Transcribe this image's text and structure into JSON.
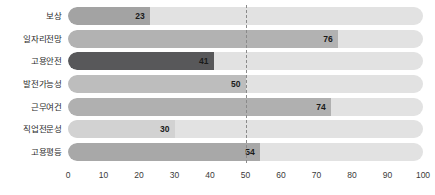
{
  "chart_data": {
    "type": "bar",
    "orientation": "horizontal",
    "title": "",
    "subtitle": "",
    "xlabel": "",
    "ylabel": "",
    "xlim": [
      0,
      100
    ],
    "xticks": [
      "0",
      "10",
      "20",
      "30",
      "40",
      "50",
      "60",
      "70",
      "80",
      "90",
      "100"
    ],
    "grid": false,
    "legend": "none",
    "reference_line": {
      "value": 50,
      "style": "dashed",
      "color": "#8a8a8a"
    },
    "track_color": "#e2e2e2",
    "categories": [
      "보상",
      "일자리전망",
      "고용안전",
      "발전가능성",
      "근무여건",
      "직업전문성",
      "고용평등"
    ],
    "values": [
      23,
      76,
      41,
      50,
      74,
      30,
      54
    ],
    "bar_colors": [
      "#a3a3a3",
      "#b2b2b2",
      "#58585a",
      "#bdbdbd",
      "#b0b0b0",
      "#d2d2d2",
      "#a8a8a8"
    ],
    "value_labels": [
      "23",
      "76",
      "41",
      "50",
      "74",
      "30",
      "54"
    ],
    "bars": [
      {
        "category": "보상",
        "value": 23,
        "label": "23",
        "color": "#a3a3a3"
      },
      {
        "category": "일자리전망",
        "value": 76,
        "label": "76",
        "color": "#b2b2b2"
      },
      {
        "category": "고용안전",
        "value": 41,
        "label": "41",
        "color": "#58585a"
      },
      {
        "category": "발전가능성",
        "value": 50,
        "label": "50",
        "color": "#bdbdbd"
      },
      {
        "category": "근무여건",
        "value": 74,
        "label": "74",
        "color": "#b0b0b0"
      },
      {
        "category": "직업전문성",
        "value": 30,
        "label": "30",
        "color": "#d2d2d2"
      },
      {
        "category": "고용평등",
        "value": 54,
        "label": "54",
        "color": "#a8a8a8"
      }
    ]
  }
}
